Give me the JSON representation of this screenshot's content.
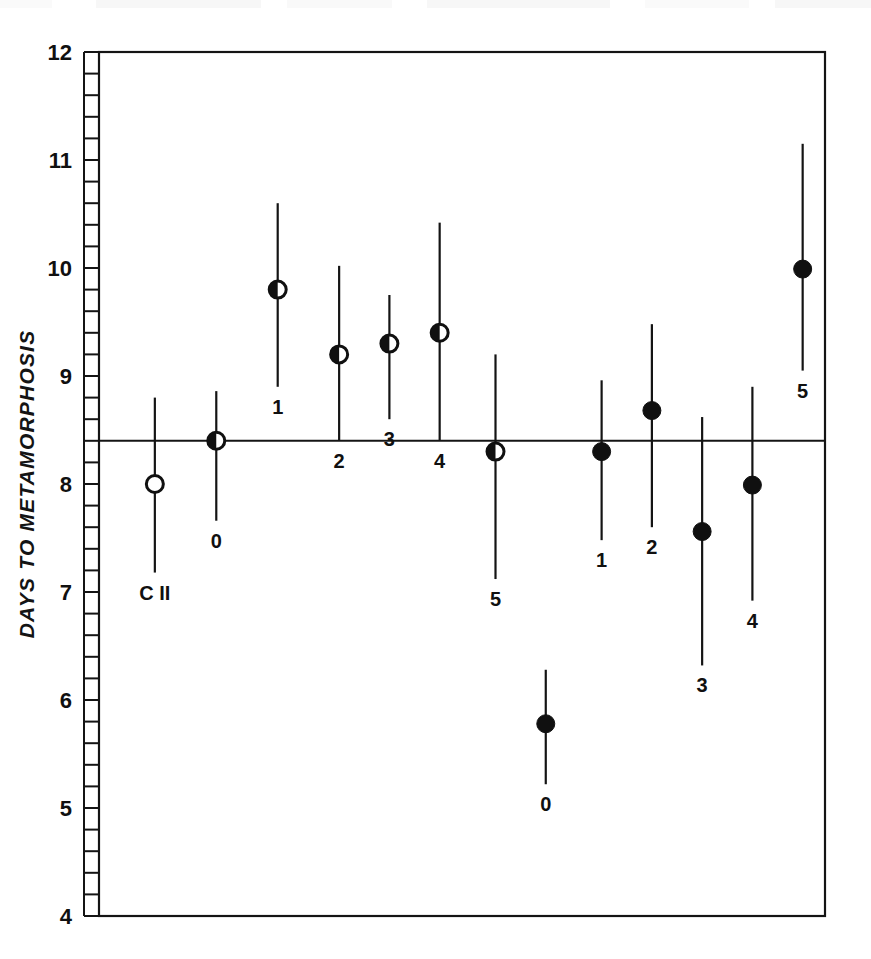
{
  "chart_data": {
    "type": "scatter",
    "title": "",
    "xlabel": "",
    "ylabel": "DAYS TO METAMORPHOSIS",
    "ylim": [
      4,
      12
    ],
    "xlim": [
      0,
      13
    ],
    "grid": false,
    "legend": "none",
    "y_ticks_major": [
      "4",
      "5",
      "6",
      "7",
      "8",
      "9",
      "10",
      "11",
      "12"
    ],
    "y_minor_per_major": 5,
    "x_axis_visible_ticks": false,
    "reference_line": {
      "label": "control mean",
      "value": 8.4,
      "orientation": "horizontal"
    },
    "marker_styles": {
      "open": "open circle (hollow)",
      "half": "half-filled circle (left half dark)",
      "filled": "solid filled circle"
    },
    "series": [
      {
        "name": "Control",
        "marker": "open",
        "points": [
          {
            "label": "C II",
            "x": 1.0,
            "y": 8.0,
            "low": 7.18,
            "high": 8.8,
            "label_pos": "below"
          }
        ]
      },
      {
        "name": "Group I",
        "marker": "half",
        "points": [
          {
            "label": "0",
            "x": 2.1,
            "y": 8.4,
            "low": 7.66,
            "high": 8.86,
            "label_pos": "below"
          },
          {
            "label": "1",
            "x": 3.2,
            "y": 9.8,
            "low": 8.9,
            "high": 10.6,
            "label_pos": "below"
          },
          {
            "label": "2",
            "x": 4.3,
            "y": 9.2,
            "low": 8.4,
            "high": 10.02,
            "label_pos": "below"
          },
          {
            "label": "3",
            "x": 5.2,
            "y": 9.3,
            "low": 8.6,
            "high": 9.75,
            "label_pos": "below"
          },
          {
            "label": "4",
            "x": 6.1,
            "y": 9.4,
            "low": 8.4,
            "high": 10.42,
            "label_pos": "below"
          },
          {
            "label": "5",
            "x": 7.1,
            "y": 8.3,
            "low": 7.12,
            "high": 9.2,
            "label_pos": "below"
          }
        ]
      },
      {
        "name": "Group II",
        "marker": "filled",
        "points": [
          {
            "label": "0",
            "x": 8.0,
            "y": 5.78,
            "low": 5.22,
            "high": 6.28,
            "label_pos": "below"
          },
          {
            "label": "1",
            "x": 9.0,
            "y": 8.3,
            "low": 7.48,
            "high": 8.96,
            "label_pos": "below"
          },
          {
            "label": "2",
            "x": 9.9,
            "y": 8.68,
            "low": 7.6,
            "high": 9.48,
            "label_pos": "below"
          },
          {
            "label": "3",
            "x": 10.8,
            "y": 7.56,
            "low": 6.32,
            "high": 8.62,
            "label_pos": "below"
          },
          {
            "label": "4",
            "x": 11.7,
            "y": 7.99,
            "low": 6.92,
            "high": 8.9,
            "label_pos": "below"
          },
          {
            "label": "5",
            "x": 12.6,
            "y": 9.99,
            "low": 9.05,
            "high": 11.15,
            "label_pos": "below"
          }
        ]
      }
    ]
  },
  "axis": {
    "y_label_text": "DAYS TO METAMORPHOSIS"
  }
}
